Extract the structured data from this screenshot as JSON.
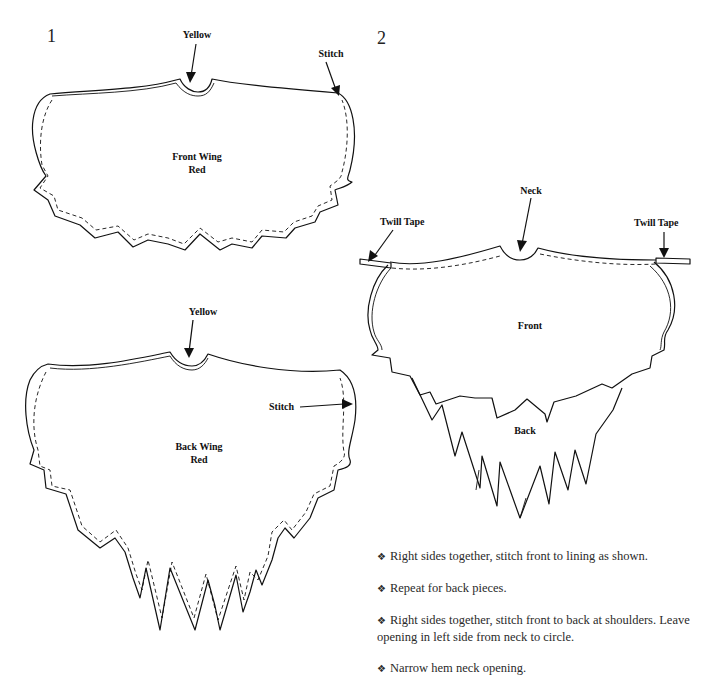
{
  "figure1": {
    "number": "1",
    "front_wing": {
      "title_line1": "Front Wing",
      "title_line2": "Red",
      "neck_label": "Yellow",
      "stitch_label": "Stitch"
    },
    "back_wing": {
      "title_line1": "Back Wing",
      "title_line2": "Red",
      "neck_label": "Yellow",
      "stitch_label": "Stitch"
    }
  },
  "figure2": {
    "number": "2",
    "labels": {
      "neck": "Neck",
      "twill_tape_left": "Twill Tape",
      "twill_tape_right": "Twill Tape",
      "front": "Front",
      "back": "Back"
    }
  },
  "instructions": {
    "bullet_glyph": "❖",
    "steps": [
      {
        "text": "Right sides together, stitch front to lining as shown."
      },
      {
        "text": "Repeat for back pieces."
      },
      {
        "text": "Right sides together, stitch front to back at shoulders. Leave opening in left side from neck to circle."
      },
      {
        "text": "Narrow hem neck opening."
      }
    ]
  }
}
